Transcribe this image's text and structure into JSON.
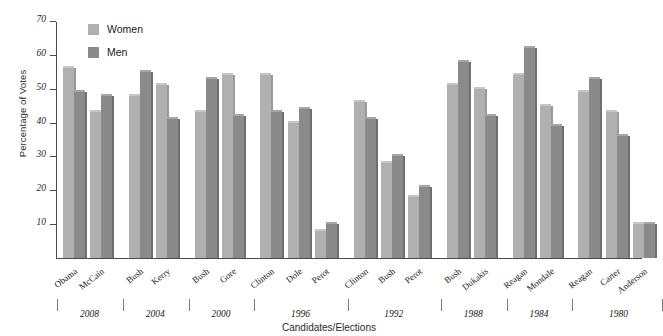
{
  "chart_data": {
    "type": "bar",
    "title": "",
    "xlabel": "Candidates/Elections",
    "ylabel": "Percentage of Votes",
    "ylim": [
      0,
      70
    ],
    "yticks": [
      10,
      20,
      30,
      40,
      50,
      60,
      70
    ],
    "grid": false,
    "legend_position": "top-left",
    "categories": [
      "Obama",
      "McCain",
      "Bush",
      "Kerry",
      "Bush",
      "Gore",
      "Clinton",
      "Dole",
      "Perot",
      "Clinton",
      "Bush",
      "Perot",
      "Bush",
      "Dukakis",
      "Reagan",
      "Mondale",
      "Reagan",
      "Carter",
      "Anderson"
    ],
    "series": [
      {
        "name": "Women",
        "color": "#b0b0b0",
        "values": [
          56,
          43,
          48,
          51,
          43,
          54,
          54,
          40,
          8,
          46,
          28,
          18,
          51,
          50,
          54,
          45,
          49,
          43,
          10
        ]
      },
      {
        "name": "Men",
        "color": "#8a8a8a",
        "values": [
          49,
          48,
          55,
          41,
          53,
          42,
          43,
          44,
          10,
          41,
          30,
          21,
          58,
          42,
          62,
          39,
          53,
          36,
          10
        ]
      }
    ],
    "groups": [
      {
        "year": "2008",
        "candidates": [
          "Obama",
          "McCain"
        ]
      },
      {
        "year": "2004",
        "candidates": [
          "Bush",
          "Kerry"
        ]
      },
      {
        "year": "2000",
        "candidates": [
          "Bush",
          "Gore"
        ]
      },
      {
        "year": "1996",
        "candidates": [
          "Clinton",
          "Dole",
          "Perot"
        ]
      },
      {
        "year": "1992",
        "candidates": [
          "Clinton",
          "Bush",
          "Perot"
        ]
      },
      {
        "year": "1988",
        "candidates": [
          "Bush",
          "Dukakis"
        ]
      },
      {
        "year": "1984",
        "candidates": [
          "Reagan",
          "Mondale"
        ]
      },
      {
        "year": "1980",
        "candidates": [
          "Reagan",
          "Carter",
          "Anderson"
        ]
      }
    ]
  },
  "legend": {
    "items": [
      {
        "label": "Women",
        "color": "#b0b0b0"
      },
      {
        "label": "Men",
        "color": "#8a8a8a"
      }
    ]
  },
  "axes": {
    "y_title": "Percentage of Votes",
    "x_title": "Candidates/Elections",
    "y_tick_labels": [
      "10",
      "20",
      "30",
      "40",
      "50",
      "60",
      "70"
    ]
  }
}
